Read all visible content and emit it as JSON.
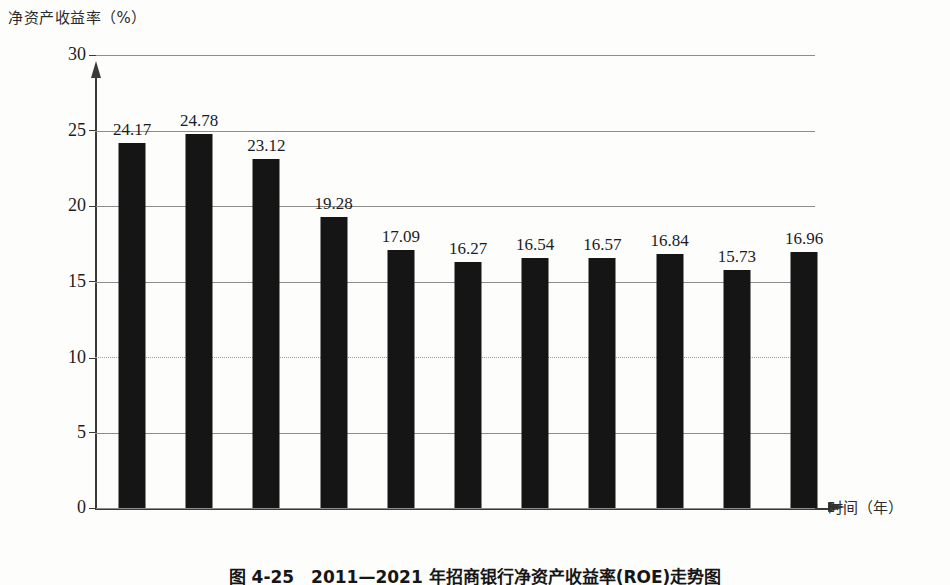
{
  "chart_data": {
    "type": "bar",
    "title": "图 4-25　2011—2021 年招商银行净资产收益率(ROE)走势图",
    "xlabel": "时间（年）",
    "ylabel": "净资产收益率（%）",
    "categories": [
      "2011",
      "2012",
      "2013",
      "2014",
      "2015",
      "2016",
      "2017",
      "2018",
      "2019",
      "2020",
      "2021"
    ],
    "values": [
      24.17,
      24.78,
      23.12,
      19.28,
      17.09,
      16.27,
      16.54,
      16.57,
      16.84,
      15.73,
      16.96
    ],
    "value_labels": [
      "24.17",
      "24.78",
      "23.12",
      "19.28",
      "17.09",
      "16.27",
      "16.54",
      "16.57",
      "16.84",
      "15.73",
      "16.96"
    ],
    "ylim": [
      0,
      30
    ],
    "yticks": [
      0,
      5,
      10,
      15,
      20,
      25,
      30
    ],
    "ytick_labels": [
      "0",
      "5",
      "10",
      "15",
      "20",
      "25",
      "30"
    ],
    "grid": true,
    "legend": false,
    "bar_color": "#151515",
    "axis_color": "#3a3a3a",
    "grid_color": "#8d8d8d",
    "background": "#fdfdfc"
  },
  "axes": {
    "y_title": "净资产收益率（%）",
    "x_title": "时间（年）"
  },
  "caption": {
    "text": "图 4-25　2011—2021 年招商银行净资产收益率(ROE)走势图"
  }
}
